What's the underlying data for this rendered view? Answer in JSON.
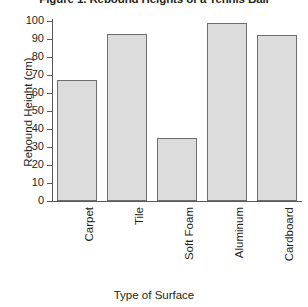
{
  "chart_data": {
    "type": "bar",
    "title": "Figure 1. Rebound Heights of a Tennis Ball",
    "xlabel": "Type of Surface",
    "ylabel": "Rebound Height (cm)",
    "categories": [
      "Carpet",
      "Tile",
      "Soft Foam",
      "Aluminum",
      "Cardboard"
    ],
    "values": [
      67,
      93,
      35,
      99,
      92
    ],
    "ylim": [
      0,
      100
    ],
    "ytick_step": 10,
    "yticks": [
      0,
      10,
      20,
      30,
      40,
      50,
      60,
      70,
      80,
      90,
      100
    ],
    "ytick_labels": [
      "0",
      "10",
      "20",
      "30",
      "40",
      "50",
      "60",
      "70",
      "80",
      "90",
      "100"
    ],
    "grid": false,
    "legend": false,
    "bar_fill_color": "#dcdcdc",
    "bar_border_color": "#6d6e71",
    "axis_color": "#58595b",
    "text_color": "#231f20",
    "background_color": "#ffffff"
  }
}
